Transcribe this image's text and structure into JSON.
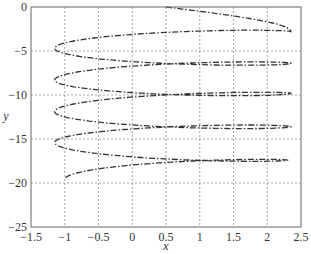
{
  "chart_data": {
    "type": "line",
    "title": "",
    "xlabel": "x",
    "ylabel": "y",
    "xlim": [
      -1.5,
      2.5
    ],
    "ylim": [
      -25,
      0
    ],
    "xticks": [
      -1.5,
      -1,
      -0.5,
      0,
      0.5,
      1,
      1.5,
      2,
      2.5
    ],
    "xtick_labels": [
      "−1.5",
      "−1",
      "−0.5",
      "0",
      "0.5",
      "1",
      "1.5",
      "2",
      "2.5"
    ],
    "yticks": [
      0,
      -5,
      -10,
      -15,
      -20,
      -25
    ],
    "ytick_labels": [
      "0",
      "−5",
      "−10",
      "−15",
      "−20",
      "−25"
    ],
    "grid": true,
    "grid_style": "dotted",
    "legend": null,
    "series": [
      {
        "name": "spiral",
        "style": "dash-dot",
        "color": "#333333",
        "key_points": [
          {
            "x": 0.5,
            "y": 0
          },
          {
            "x": 2.35,
            "y": -2.8
          },
          {
            "x": -1.15,
            "y": -4.7
          },
          {
            "x": 2.35,
            "y": -6.4
          },
          {
            "x": -1.15,
            "y": -8.3
          },
          {
            "x": 2.35,
            "y": -9.8
          },
          {
            "x": -1.15,
            "y": -11.9
          },
          {
            "x": 2.35,
            "y": -13.6
          },
          {
            "x": -1.15,
            "y": -15.4
          },
          {
            "x": 2.3,
            "y": -17.4
          },
          {
            "x": -1.0,
            "y": -19.6
          }
        ]
      }
    ]
  },
  "colors": {
    "axis": "#7f7f7f",
    "grid": "#8a8a8a",
    "curve": "#333333",
    "background": "#ffffff"
  }
}
